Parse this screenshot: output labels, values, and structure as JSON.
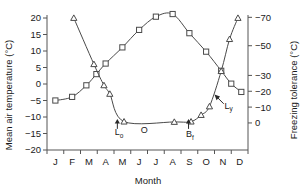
{
  "chart_data": {
    "type": "line",
    "title": "",
    "xlabel": "Month",
    "ylabel": "Mean air temperature (°C)",
    "y2label": "Freezing tolerance (°C)",
    "categories": [
      "J",
      "F",
      "M",
      "A",
      "M",
      "J",
      "J",
      "A",
      "S",
      "O",
      "N",
      "D"
    ],
    "ylim": [
      -20,
      20
    ],
    "yticks": [
      -20,
      -15,
      -10,
      -5,
      0,
      5,
      10,
      15,
      20
    ],
    "yticklabels": [
      "−20",
      "−15",
      "−10",
      "−5",
      "0",
      "5",
      "10",
      "15",
      "20"
    ],
    "y2ticks_labels": [
      "0",
      "−10",
      "−20",
      "−30",
      "−50",
      "−70"
    ],
    "y2ticks_values": [
      0,
      -10,
      -20,
      -30,
      -50,
      -70
    ],
    "grid": false,
    "legend": "none",
    "series": [
      {
        "name": "Mean air temperature",
        "marker": "square",
        "axis": "left",
        "points": [
          {
            "x": "J",
            "xf": 0.5,
            "y": -5.0
          },
          {
            "x": "F",
            "xf": 1.5,
            "y": -3.9
          },
          {
            "x": "M",
            "xf": 2.35,
            "y": -0.4
          },
          {
            "x": "M+",
            "xf": 2.95,
            "y": 3.0
          },
          {
            "x": "A",
            "xf": 3.5,
            "y": 6.2
          },
          {
            "x": "M",
            "xf": 4.5,
            "y": 11.1
          },
          {
            "x": "J",
            "xf": 5.5,
            "y": 16.4
          },
          {
            "x": "J",
            "xf": 6.5,
            "y": 20.4
          },
          {
            "x": "A",
            "xf": 7.5,
            "y": 21.2
          },
          {
            "x": "S",
            "xf": 8.5,
            "y": 15.4
          },
          {
            "x": "O",
            "xf": 9.5,
            "y": 9.8
          },
          {
            "x": "N",
            "xf": 10.4,
            "y": 4.0
          },
          {
            "x": "N+",
            "xf": 11.0,
            "y": 0.1
          },
          {
            "x": "D",
            "xf": 11.6,
            "y": -2.4
          }
        ]
      },
      {
        "name": "Freezing tolerance",
        "marker": "triangle",
        "axis": "right",
        "points": [
          {
            "x": "F",
            "xf": 1.6,
            "y": 20.0
          },
          {
            "x": "M",
            "xf": 2.8,
            "y": 6.0
          },
          {
            "x": "A",
            "xf": 3.4,
            "y": -0.4
          },
          {
            "x": "A+",
            "xf": 3.75,
            "y": -3.0
          },
          {
            "x": "M",
            "xf": 4.6,
            "y": -11.4
          },
          {
            "x": "A",
            "xf": 7.6,
            "y": -11.5
          },
          {
            "x": "S",
            "xf": 8.6,
            "y": -11.4
          },
          {
            "x": "O",
            "xf": 9.2,
            "y": -9.4
          },
          {
            "x": "O+",
            "xf": 9.7,
            "y": -6.8
          },
          {
            "x": "N",
            "xf": 10.4,
            "y": 3.9
          },
          {
            "x": "N+",
            "xf": 10.9,
            "y": 13.6
          },
          {
            "x": "D",
            "xf": 11.4,
            "y": 20.0
          }
        ]
      }
    ],
    "annotations": [
      {
        "name": "lo-event",
        "label": "L",
        "sub": "o",
        "arrow_x": 4.2,
        "arrow_y_top": -10.6,
        "arrow_y_bottom": -13.6,
        "text_x": 4.05,
        "text_y": -15.6
      },
      {
        "name": "o-event",
        "label": "O",
        "sub": "",
        "text_x": 5.6,
        "text_y": -14.7
      },
      {
        "name": "bf-event",
        "label": "B",
        "sub": "f",
        "arrow_x": 8.45,
        "arrow_y_top": -10.6,
        "arrow_y_bottom": -13.6,
        "text_x": 8.3,
        "text_y": -16.2
      },
      {
        "name": "ly-event",
        "label": "L",
        "sub": "y",
        "arrow_from_x": 10.55,
        "arrow_from_y": -6.0,
        "arrow_to_x": 10.0,
        "arrow_to_y": -3.2,
        "text_x": 10.6,
        "text_y": -7.6
      }
    ]
  }
}
